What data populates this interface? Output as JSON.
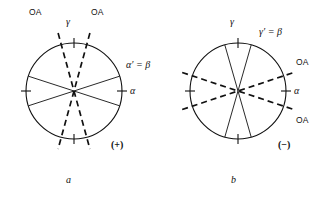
{
  "figure": {
    "type": "optical-indicatrix-diagram-pair",
    "background_color": "#ffffff",
    "line_color": "#111111",
    "panels": [
      {
        "id": "a",
        "caption": "a",
        "sign_label": "(+)",
        "circle": {
          "cx": 74,
          "cy": 91,
          "r": 48
        },
        "labels": {
          "oa_left": "OA",
          "oa_right": "OA",
          "gamma": "γ",
          "alpha_prime_beta": "α′ = β",
          "alpha": "α"
        },
        "solid_lines": [
          {
            "name": "solid-shallow-up-right",
            "angle_deg": 18
          },
          {
            "name": "solid-shallow-down-right",
            "angle_deg": -18
          }
        ],
        "dashed_lines": [
          {
            "name": "dashed-optic-axis-left",
            "angle_deg": 74
          },
          {
            "name": "dashed-optic-axis-right",
            "angle_deg": 106
          }
        ],
        "ticks": [
          "top",
          "bottom",
          "left",
          "right"
        ]
      },
      {
        "id": "b",
        "caption": "b",
        "sign_label": "(−)",
        "circle": {
          "cx": 238,
          "cy": 91,
          "r": 48
        },
        "labels": {
          "gamma": "γ",
          "gamma_prime_beta": "γ′ = β",
          "oa_upper": "OA",
          "oa_lower": "OA",
          "alpha": "α"
        },
        "solid_lines": [
          {
            "name": "solid-steep-up-left",
            "angle_deg": 74
          },
          {
            "name": "solid-steep-up-right",
            "angle_deg": 106
          }
        ],
        "dashed_lines": [
          {
            "name": "dashed-optic-axis-upper",
            "angle_deg": 18
          },
          {
            "name": "dashed-optic-axis-lower",
            "angle_deg": -18
          }
        ],
        "ticks": [
          "top",
          "bottom",
          "left",
          "right"
        ]
      }
    ]
  }
}
